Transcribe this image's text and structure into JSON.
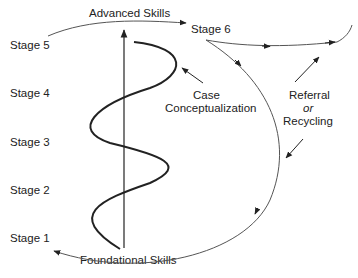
{
  "diagram": {
    "type": "developmental-stage-model",
    "stage_labels": [
      "Stage 1",
      "Stage 2",
      "Stage 3",
      "Stage 4",
      "Stage 5",
      "Stage 6"
    ],
    "labels": {
      "advanced_skills": "Advanced Skills",
      "foundational_skills": "Foundational Skills",
      "case": "Case",
      "conceptualization": "Conceptualization",
      "referral": "Referral",
      "or": "or",
      "recycling": "Recycling"
    },
    "colors": {
      "line": "#222222",
      "thin_line": "#555555",
      "background": "#ffffff"
    }
  }
}
